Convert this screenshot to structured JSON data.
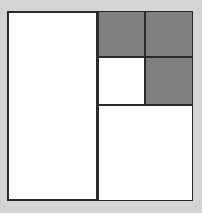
{
  "figure": {
    "colors": {
      "background": "#d4d4d4",
      "line": "#2b2b2b",
      "fill_white": "#ffffff",
      "fill_gray": "#808080"
    },
    "frame": {
      "name": "outer-square",
      "x": 7,
      "y": 11,
      "width": 186,
      "height": 190,
      "border_width": 2,
      "fill": "#ffffff"
    },
    "cells": [
      {
        "name": "left-tall-rectangle",
        "fill": "#ffffff",
        "shade": "white",
        "x": 7,
        "y": 11,
        "width": 91,
        "height": 190
      },
      {
        "name": "top-left-gray-square",
        "fill": "#808080",
        "shade": "gray",
        "x": 98,
        "y": 11,
        "width": 47,
        "height": 46
      },
      {
        "name": "top-right-gray-square",
        "fill": "#808080",
        "shade": "gray",
        "x": 145,
        "y": 11,
        "width": 48,
        "height": 46
      },
      {
        "name": "middle-white-square",
        "fill": "#ffffff",
        "shade": "white",
        "x": 98,
        "y": 57,
        "width": 47,
        "height": 48
      },
      {
        "name": "middle-right-gray-square",
        "fill": "#808080",
        "shade": "gray",
        "x": 145,
        "y": 57,
        "width": 48,
        "height": 48
      },
      {
        "name": "bottom-right-white-rectangle",
        "fill": "#ffffff",
        "shade": "white",
        "x": 98,
        "y": 105,
        "width": 95,
        "height": 96
      }
    ]
  }
}
